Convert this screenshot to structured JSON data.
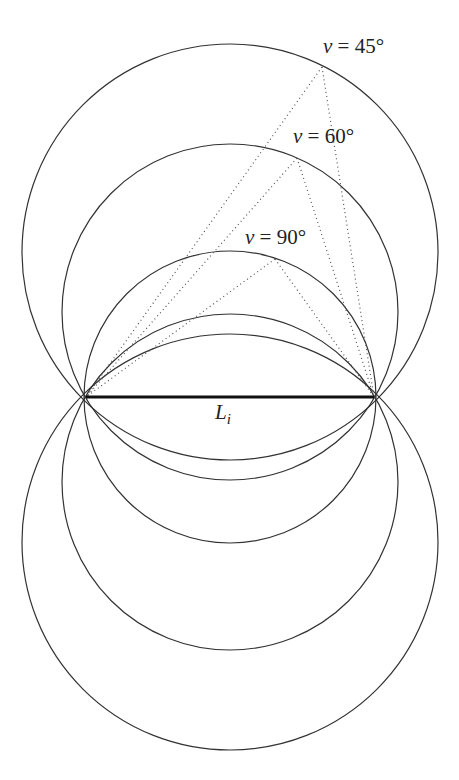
{
  "figure": {
    "segment": {
      "label_main": "L",
      "label_sub": "i",
      "endpoints": [
        [
          86,
          397
        ],
        [
          374,
          397
        ]
      ]
    },
    "arcs": [
      {
        "id": "v45",
        "label": "v = 45°",
        "label_var": "v",
        "label_eq": " = 45°",
        "angle_deg": 45,
        "upper_center": [
          230,
          252
        ],
        "lower_center": [
          230,
          542
        ],
        "radius": 208,
        "apex": [
          322,
          67
        ],
        "label_pos": [
          323,
          53
        ]
      },
      {
        "id": "v60",
        "label": "v = 60°",
        "label_var": "v",
        "label_eq": " = 60°",
        "angle_deg": 60,
        "upper_center": [
          230,
          312
        ],
        "lower_center": [
          230,
          482
        ],
        "radius": 168,
        "apex": [
          297,
          158
        ],
        "label_pos": [
          293,
          143
        ]
      },
      {
        "id": "v90",
        "label": "v = 90°",
        "label_var": "v",
        "label_eq": " = 90°",
        "angle_deg": 90,
        "upper_center": [
          230,
          397
        ],
        "lower_center": [
          230,
          397
        ],
        "radius": 146,
        "apex": [
          275,
          259
        ],
        "label_pos": [
          245,
          244
        ]
      }
    ]
  }
}
